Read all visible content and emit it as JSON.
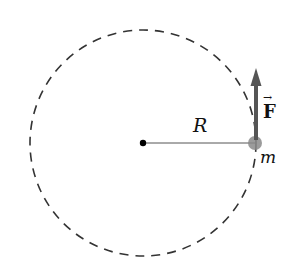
{
  "diagram": {
    "type": "circular-motion",
    "labels": {
      "radius": "R",
      "mass": "m",
      "force": "F",
      "force_vector_mark": "→"
    },
    "colors": {
      "circle": "#333333",
      "radius_line": "#555555",
      "mass": "#8a8a8a",
      "force_arrow": "#555555",
      "center": "#000000"
    }
  }
}
